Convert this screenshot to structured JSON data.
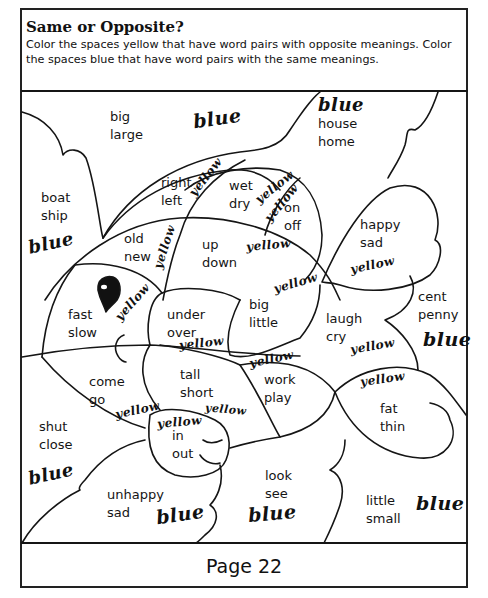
{
  "worksheet": {
    "title": "Same or Opposite?",
    "instructions": "Color the spaces yellow that have word pairs with opposite meanings. Color the spaces blue that have word pairs with the same meanings.",
    "page_label": "Page 22"
  },
  "regions": [
    {
      "id": "big-large",
      "words": [
        "big",
        "large"
      ],
      "answer": "blue"
    },
    {
      "id": "house-home",
      "words": [
        "house",
        "home"
      ],
      "answer": "blue"
    },
    {
      "id": "boat-ship",
      "words": [
        "boat",
        "ship"
      ],
      "answer": "blue"
    },
    {
      "id": "right-left",
      "words": [
        "right",
        "left"
      ],
      "answer": "yellow"
    },
    {
      "id": "wet-dry",
      "words": [
        "wet",
        "dry"
      ],
      "answer": "yellow"
    },
    {
      "id": "on-off",
      "words": [
        "on",
        "off"
      ],
      "answer": "yellow"
    },
    {
      "id": "old-new",
      "words": [
        "old",
        "new"
      ],
      "answer": "yellow"
    },
    {
      "id": "up-down",
      "words": [
        "up",
        "down"
      ],
      "answer": "yellow"
    },
    {
      "id": "happy-sad",
      "words": [
        "happy",
        "sad"
      ],
      "answer": "yellow"
    },
    {
      "id": "fast-slow",
      "words": [
        "fast",
        "slow"
      ],
      "answer": "yellow"
    },
    {
      "id": "under-over",
      "words": [
        "under",
        "over"
      ],
      "answer": "yellow"
    },
    {
      "id": "big-little",
      "words": [
        "big",
        "little"
      ],
      "answer": "yellow"
    },
    {
      "id": "laugh-cry",
      "words": [
        "laugh",
        "cry"
      ],
      "answer": "yellow"
    },
    {
      "id": "cent-penny",
      "words": [
        "cent",
        "penny"
      ],
      "answer": "blue"
    },
    {
      "id": "come-go",
      "words": [
        "come",
        "go"
      ],
      "answer": "yellow"
    },
    {
      "id": "tall-short",
      "words": [
        "tall",
        "short"
      ],
      "answer": "yellow"
    },
    {
      "id": "work-play",
      "words": [
        "work",
        "play"
      ],
      "answer": "yellow"
    },
    {
      "id": "fat-thin",
      "words": [
        "fat",
        "thin"
      ],
      "answer": "yellow"
    },
    {
      "id": "shut-close",
      "words": [
        "shut",
        "close"
      ],
      "answer": "blue"
    },
    {
      "id": "in-out",
      "words": [
        "in",
        "out"
      ],
      "answer": "yellow"
    },
    {
      "id": "unhappy-sad",
      "words": [
        "unhappy",
        "sad"
      ],
      "answer": "blue"
    },
    {
      "id": "look-see",
      "words": [
        "look",
        "see"
      ],
      "answer": "blue"
    },
    {
      "id": "little-small",
      "words": [
        "little",
        "small"
      ],
      "answer": "blue"
    }
  ],
  "labels": {
    "big_large": "big\nlarge",
    "house_home": "house\nhome",
    "boat_ship": "boat\nship",
    "right_left": "right\nleft",
    "wet_dry": "wet\ndry",
    "on_off": "on\noff",
    "old_new": "old\nnew",
    "up_down": "up\ndown",
    "happy_sad": "happy\nsad",
    "fast_slow": "fast\nslow",
    "under_over": "under\nover",
    "big_little": "big\nlittle",
    "laugh_cry": "laugh\ncry",
    "cent_penny": "cent\npenny",
    "come_go": "come\ngo",
    "tall_short": "tall\nshort",
    "work_play": "work\nplay",
    "fat_thin": "fat\nthin",
    "shut_close": "shut\nclose",
    "in_out": "in\nout",
    "unhappy_sad": "unhappy\nsad",
    "look_see": "look\nsee",
    "little_small": "little\nsmall"
  },
  "handwriting": {
    "blue": "blue",
    "yellow": "yellow"
  }
}
